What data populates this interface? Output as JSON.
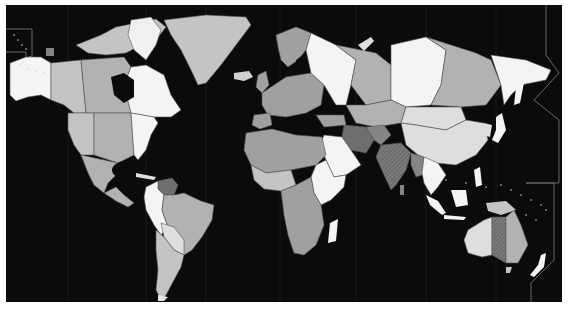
{
  "map": {
    "type": "choropleth-world-map",
    "colorscale": "grayscale",
    "background": "#0b0b0b",
    "frame_border": "#ffffff",
    "legend": null,
    "title": null,
    "shades": {
      "white": "#f4f4f4",
      "very_light": "#dedede",
      "light": "#c4c4c4",
      "medium_light": "#b2b2b2",
      "medium": "#a0a0a0",
      "medium_dark": "#858585",
      "dark": "#6e6e6e"
    },
    "regions": [
      {
        "name": "Alaska",
        "shade": "white"
      },
      {
        "name": "Canada West",
        "shade": "light"
      },
      {
        "name": "Canada Central",
        "shade": "medium_light"
      },
      {
        "name": "Canada East / Quebec",
        "shade": "white"
      },
      {
        "name": "Canadian Arctic Islands",
        "shade": "light"
      },
      {
        "name": "Greenland",
        "shade": "light"
      },
      {
        "name": "Iceland",
        "shade": "light"
      },
      {
        "name": "USA West",
        "shade": "light"
      },
      {
        "name": "USA Central",
        "shade": "medium_light"
      },
      {
        "name": "USA East",
        "shade": "white"
      },
      {
        "name": "Mexico",
        "shade": "medium_light"
      },
      {
        "name": "Central America",
        "shade": "medium_light"
      },
      {
        "name": "Venezuela",
        "shade": "dark"
      },
      {
        "name": "Colombia / Peru / Ecuador",
        "shade": "white"
      },
      {
        "name": "Brazil",
        "shade": "medium_light"
      },
      {
        "name": "Bolivia / Paraguay",
        "shade": "very_light"
      },
      {
        "name": "Argentina / Chile",
        "shade": "light"
      },
      {
        "name": "Europe",
        "shade": "medium"
      },
      {
        "name": "Scandinavia",
        "shade": "medium"
      },
      {
        "name": "European Russia",
        "shade": "white"
      },
      {
        "name": "Western Siberia",
        "shade": "medium_light"
      },
      {
        "name": "Central Siberia",
        "shade": "white"
      },
      {
        "name": "Eastern Siberia",
        "shade": "medium_light"
      },
      {
        "name": "Russian Far East",
        "shade": "white"
      },
      {
        "name": "Kazakhstan / Central Asia",
        "shade": "medium_light"
      },
      {
        "name": "Mongolia",
        "shade": "very_light"
      },
      {
        "name": "China",
        "shade": "very_light"
      },
      {
        "name": "Iran",
        "shade": "dark"
      },
      {
        "name": "Afghanistan",
        "shade": "medium_dark"
      },
      {
        "name": "India",
        "shade": "medium_dark",
        "hatched": true
      },
      {
        "name": "Myanmar",
        "shade": "medium_dark"
      },
      {
        "name": "Southeast Asia",
        "shade": "white"
      },
      {
        "name": "Japan",
        "shade": "white"
      },
      {
        "name": "Indonesia",
        "shade": "white"
      },
      {
        "name": "Papua New Guinea",
        "shade": "light"
      },
      {
        "name": "Arabian Peninsula",
        "shade": "white"
      },
      {
        "name": "North Africa",
        "shade": "medium"
      },
      {
        "name": "West Africa",
        "shade": "light"
      },
      {
        "name": "East Africa",
        "shade": "white"
      },
      {
        "name": "Central / Southern Africa",
        "shade": "medium"
      },
      {
        "name": "Madagascar",
        "shade": "white"
      },
      {
        "name": "Western Australia",
        "shade": "very_light"
      },
      {
        "name": "Central Australia",
        "shade": "dark",
        "hatched": true
      },
      {
        "name": "Eastern Australia",
        "shade": "medium_light"
      },
      {
        "name": "Tasmania",
        "shade": "light"
      },
      {
        "name": "New Zealand",
        "shade": "white"
      },
      {
        "name": "Hawaii area marker",
        "shade": "medium_dark"
      }
    ]
  }
}
